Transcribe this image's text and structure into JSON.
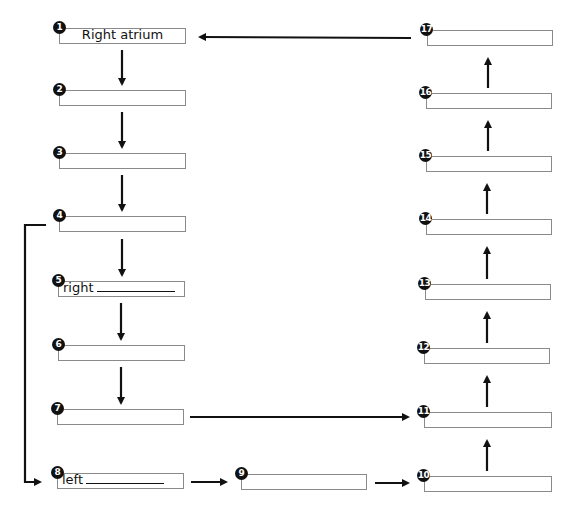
{
  "diagram": {
    "nodes": [
      {
        "id": 1,
        "label": "1",
        "text": "Right atrium",
        "blank": false
      },
      {
        "id": 2,
        "label": "2",
        "text": "",
        "blank": false
      },
      {
        "id": 3,
        "label": "3",
        "text": "",
        "blank": false
      },
      {
        "id": 4,
        "label": "4",
        "text": "",
        "blank": false
      },
      {
        "id": 5,
        "label": "5",
        "text": "right",
        "blank": true
      },
      {
        "id": 6,
        "label": "6",
        "text": "",
        "blank": false
      },
      {
        "id": 7,
        "label": "7",
        "text": "",
        "blank": false
      },
      {
        "id": 8,
        "label": "8",
        "text": "left",
        "blank": true
      },
      {
        "id": 9,
        "label": "9",
        "text": "",
        "blank": false
      },
      {
        "id": 10,
        "label": "10",
        "text": "",
        "blank": false
      },
      {
        "id": 11,
        "label": "11",
        "text": "",
        "blank": false
      },
      {
        "id": 12,
        "label": "12",
        "text": "",
        "blank": false
      },
      {
        "id": 13,
        "label": "13",
        "text": "",
        "blank": false
      },
      {
        "id": 14,
        "label": "14",
        "text": "",
        "blank": false
      },
      {
        "id": 15,
        "label": "15",
        "text": "",
        "blank": false
      },
      {
        "id": 16,
        "label": "16",
        "text": "",
        "blank": false
      },
      {
        "id": 17,
        "label": "17",
        "text": "",
        "blank": false
      }
    ],
    "edges": [
      {
        "from": 1,
        "to": 2
      },
      {
        "from": 2,
        "to": 3
      },
      {
        "from": 3,
        "to": 4
      },
      {
        "from": 4,
        "to": 5
      },
      {
        "from": 5,
        "to": 6
      },
      {
        "from": 6,
        "to": 7
      },
      {
        "from": 4,
        "to": 8
      },
      {
        "from": 7,
        "to": 11
      },
      {
        "from": 8,
        "to": 9
      },
      {
        "from": 9,
        "to": 10
      },
      {
        "from": 10,
        "to": 11
      },
      {
        "from": 11,
        "to": 12
      },
      {
        "from": 12,
        "to": 13
      },
      {
        "from": 13,
        "to": 14
      },
      {
        "from": 14,
        "to": 15
      },
      {
        "from": 15,
        "to": 16
      },
      {
        "from": 16,
        "to": 17
      },
      {
        "from": 17,
        "to": 1
      }
    ],
    "colors": {
      "line": "#111111",
      "box_border": "#8a8a8a",
      "badge": "#111111"
    }
  }
}
